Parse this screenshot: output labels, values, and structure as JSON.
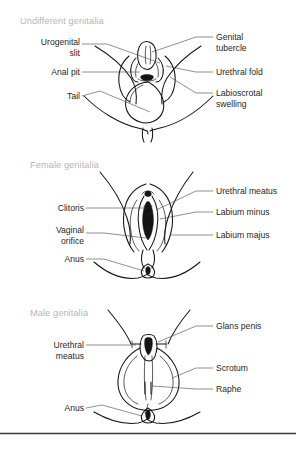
{
  "figure": {
    "background_color": "#ffffff",
    "title_color": "#b6b6b6",
    "label_color": "#1f1f1f",
    "leader_color": "#4a4a4a",
    "line_color": "#141414",
    "divider_color": "#3b3b3b"
  },
  "panels": [
    {
      "id": "undifferentiated",
      "title": "Undifferent genitalia",
      "labels_left": [
        {
          "name": "urogenital-slit",
          "lines": [
            "Urogenital",
            "slit"
          ]
        },
        {
          "name": "anal-pit",
          "lines": [
            "Anal pit"
          ]
        },
        {
          "name": "tail",
          "lines": [
            "Tail"
          ]
        }
      ],
      "labels_right": [
        {
          "name": "genital-tubercle",
          "lines": [
            "Genital",
            "tubercle"
          ]
        },
        {
          "name": "urethral-fold",
          "lines": [
            "Urethral fold"
          ]
        },
        {
          "name": "labioscrotal-swelling",
          "lines": [
            "Labioscrotal",
            "swelling"
          ]
        }
      ]
    },
    {
      "id": "female",
      "title": "Female genitalia",
      "labels_left": [
        {
          "name": "clitoris",
          "lines": [
            "Clitoris"
          ]
        },
        {
          "name": "vaginal-orifice",
          "lines": [
            "Vaginal",
            "orifice"
          ]
        },
        {
          "name": "anus",
          "lines": [
            "Anus"
          ]
        }
      ],
      "labels_right": [
        {
          "name": "urethral-meatus",
          "lines": [
            "Urethral meatus"
          ]
        },
        {
          "name": "labium-minus",
          "lines": [
            "Labium minus"
          ]
        },
        {
          "name": "labium-majus",
          "lines": [
            "Labium majus"
          ]
        }
      ]
    },
    {
      "id": "male",
      "title": "Male genitalia",
      "labels_left": [
        {
          "name": "urethral-meatus",
          "lines": [
            "Urethral",
            "meatus"
          ]
        },
        {
          "name": "anus",
          "lines": [
            "Anus"
          ]
        }
      ],
      "labels_right": [
        {
          "name": "glans-penis",
          "lines": [
            "Glans penis"
          ]
        },
        {
          "name": "scrotum",
          "lines": [
            "Scrotum"
          ]
        },
        {
          "name": "raphe",
          "lines": [
            "Raphe"
          ]
        }
      ]
    }
  ],
  "text": {
    "p1_title": "Undifferent genitalia",
    "p1_urogenital_1": "Urogenital",
    "p1_urogenital_2": "slit",
    "p1_analpit": "Anal pit",
    "p1_tail": "Tail",
    "p1_tubercle_1": "Genital",
    "p1_tubercle_2": "tubercle",
    "p1_urethralfold": "Urethral fold",
    "p1_labioscrotal_1": "Labioscrotal",
    "p1_labioscrotal_2": "swelling",
    "p2_title": "Female genitalia",
    "p2_clitoris": "Clitoris",
    "p2_vaginal_1": "Vaginal",
    "p2_vaginal_2": "orifice",
    "p2_anus": "Anus",
    "p2_meatus": "Urethral meatus",
    "p2_minus": "Labium minus",
    "p2_majus": "Labium majus",
    "p3_title": "Male genitalia",
    "p3_meatus_1": "Urethral",
    "p3_meatus_2": "meatus",
    "p3_anus": "Anus",
    "p3_glans": "Glans penis",
    "p3_scrotum": "Scrotum",
    "p3_raphe": "Raphe"
  }
}
